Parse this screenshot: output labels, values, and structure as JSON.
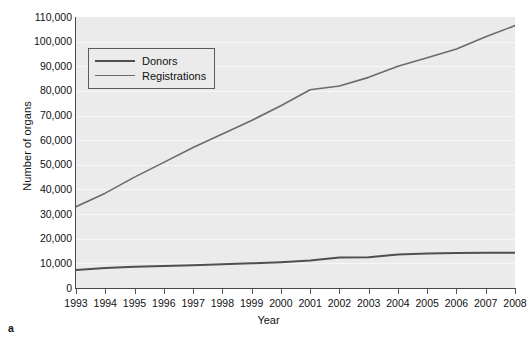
{
  "caption": {
    "panel_label": "a"
  },
  "axes": {
    "ylabel": "Number of organs",
    "xlabel": "Year",
    "yticks": [
      "0",
      "10,000",
      "20,000",
      "30,000",
      "40,000",
      "50,000",
      "60,000",
      "70,000",
      "80,000",
      "90,000",
      "100,000",
      "110,000"
    ],
    "xticks": [
      "1993",
      "1994",
      "1995",
      "1996",
      "1997",
      "1998",
      "1999",
      "2000",
      "2001",
      "2002",
      "2003",
      "2004",
      "2005",
      "2006",
      "2007",
      "2008"
    ]
  },
  "legend": {
    "position": "upper-left-inside",
    "entries": [
      {
        "label": "Donors",
        "color": "#4f4f4f",
        "width": 2.0
      },
      {
        "label": "Registrations",
        "color": "#6b6b6b",
        "width": 1.6
      }
    ]
  },
  "style": {
    "plot_background": "#ebebeb",
    "gridline_color": "#f7f7f7",
    "axis_color": "#4a4a4a",
    "text_color": "#111111"
  },
  "chart_data": {
    "type": "line",
    "title": "",
    "xlabel": "Year",
    "ylabel": "Number of organs",
    "xlim": [
      1993,
      2008
    ],
    "ylim": [
      0,
      110000
    ],
    "ytick_step": 10000,
    "grid": true,
    "legend_position": "upper left (inside axes)",
    "x": [
      1993,
      1994,
      1995,
      1996,
      1997,
      1998,
      1999,
      2000,
      2001,
      2002,
      2003,
      2004,
      2005,
      2006,
      2007,
      2008
    ],
    "series": [
      {
        "name": "Registrations",
        "color": "#6b6b6b",
        "values": [
          33000,
          38500,
          45000,
          51000,
          57000,
          62500,
          68000,
          74000,
          80500,
          82000,
          85500,
          90000,
          93500,
          97000,
          102000,
          106500
        ]
      },
      {
        "name": "Donors",
        "color": "#4f4f4f",
        "values": [
          7300,
          8100,
          8600,
          8900,
          9200,
          9600,
          10000,
          10500,
          11200,
          12400,
          12500,
          13600,
          14000,
          14200,
          14300,
          14300
        ]
      }
    ]
  }
}
